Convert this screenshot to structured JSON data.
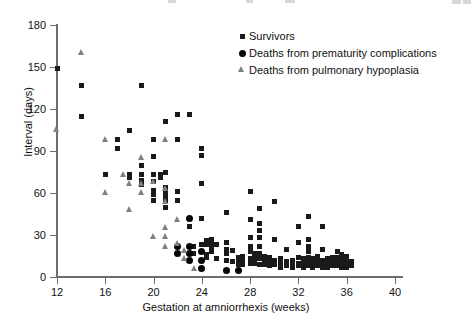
{
  "chart_data": {
    "type": "scatter",
    "title": "",
    "xlabel": "Gestation at amniorrhexis (weeks)",
    "ylabel": "Interval (days)",
    "xlim": [
      12,
      40
    ],
    "ylim": [
      0,
      180
    ],
    "xticks": [
      12,
      16,
      20,
      24,
      28,
      32,
      36,
      40
    ],
    "yticks": [
      0,
      30,
      60,
      90,
      120,
      150,
      180
    ],
    "grid": false,
    "legend_position": "top-right",
    "colors": {
      "survivors": "#1a1a1a",
      "deaths_prematurity": "#050505",
      "deaths_pulmonary": "#808080",
      "axis": "#6e6e6e",
      "background": "#ffffff"
    },
    "series": [
      {
        "name": "Survivors",
        "marker": "square",
        "color": "#1a1a1a",
        "points": [
          [
            12.0,
            149
          ],
          [
            14.0,
            137
          ],
          [
            14.0,
            115
          ],
          [
            16.0,
            73
          ],
          [
            17.0,
            98
          ],
          [
            17.0,
            92
          ],
          [
            18.0,
            105
          ],
          [
            18.0,
            73
          ],
          [
            18.0,
            71
          ],
          [
            19.0,
            137
          ],
          [
            19.0,
            80
          ],
          [
            19.0,
            73
          ],
          [
            19.0,
            69
          ],
          [
            19.0,
            66
          ],
          [
            20.0,
            98
          ],
          [
            20.0,
            86
          ],
          [
            20.0,
            73
          ],
          [
            20.0,
            68
          ],
          [
            20.0,
            62
          ],
          [
            20.0,
            59
          ],
          [
            20.0,
            55
          ],
          [
            20.6,
            73
          ],
          [
            20.6,
            71
          ],
          [
            21.0,
            111
          ],
          [
            21.0,
            75
          ],
          [
            21.0,
            64
          ],
          [
            21.0,
            61
          ],
          [
            21.0,
            58
          ],
          [
            21.0,
            55
          ],
          [
            21.0,
            50
          ],
          [
            22.0,
            116
          ],
          [
            22.0,
            98
          ],
          [
            22.0,
            61
          ],
          [
            22.0,
            55
          ],
          [
            23.0,
            116
          ],
          [
            23.0,
            36
          ],
          [
            23.3,
            22
          ],
          [
            23.3,
            17
          ],
          [
            24.0,
            92
          ],
          [
            24.0,
            87
          ],
          [
            24.0,
            67
          ],
          [
            24.0,
            42
          ],
          [
            24.0,
            23
          ],
          [
            24.0,
            18
          ],
          [
            24.0,
            12
          ],
          [
            24.4,
            26
          ],
          [
            24.4,
            23
          ],
          [
            24.4,
            16
          ],
          [
            24.4,
            14
          ],
          [
            24.8,
            27
          ],
          [
            24.8,
            24
          ],
          [
            24.8,
            22
          ],
          [
            24.8,
            18
          ],
          [
            25.2,
            23
          ],
          [
            25.2,
            13
          ],
          [
            26.0,
            46
          ],
          [
            26.0,
            25
          ],
          [
            26.0,
            20
          ],
          [
            26.0,
            17
          ],
          [
            26.0,
            12
          ],
          [
            26.5,
            19
          ],
          [
            26.5,
            11
          ],
          [
            27.0,
            14
          ],
          [
            27.0,
            11
          ],
          [
            27.0,
            9
          ],
          [
            27.4,
            15
          ],
          [
            27.4,
            12
          ],
          [
            27.4,
            9
          ],
          [
            28.0,
            61
          ],
          [
            28.0,
            41
          ],
          [
            28.0,
            28
          ],
          [
            28.0,
            22
          ],
          [
            28.0,
            18
          ],
          [
            28.0,
            13
          ],
          [
            28.0,
            10
          ],
          [
            28.4,
            17
          ],
          [
            28.4,
            13
          ],
          [
            28.4,
            10
          ],
          [
            28.8,
            49
          ],
          [
            28.8,
            38
          ],
          [
            28.8,
            33
          ],
          [
            28.8,
            28
          ],
          [
            28.8,
            22
          ],
          [
            28.8,
            17
          ],
          [
            28.8,
            13
          ],
          [
            28.8,
            9
          ],
          [
            29.2,
            15
          ],
          [
            29.2,
            12
          ],
          [
            29.2,
            9
          ],
          [
            29.6,
            14
          ],
          [
            29.6,
            11
          ],
          [
            29.6,
            8
          ],
          [
            30.0,
            54
          ],
          [
            30.0,
            27
          ],
          [
            30.0,
            12
          ],
          [
            30.0,
            9
          ],
          [
            30.5,
            13
          ],
          [
            30.5,
            10
          ],
          [
            30.5,
            7
          ],
          [
            31.0,
            20
          ],
          [
            31.0,
            11
          ],
          [
            31.0,
            8
          ],
          [
            31.5,
            12
          ],
          [
            31.5,
            9
          ],
          [
            31.5,
            7
          ],
          [
            32.0,
            36
          ],
          [
            32.0,
            25
          ],
          [
            32.0,
            14
          ],
          [
            32.0,
            10
          ],
          [
            32.0,
            8
          ],
          [
            32.4,
            13
          ],
          [
            32.4,
            10
          ],
          [
            32.4,
            7
          ],
          [
            32.8,
            43
          ],
          [
            32.8,
            27
          ],
          [
            32.8,
            22
          ],
          [
            32.8,
            18
          ],
          [
            32.8,
            14
          ],
          [
            32.8,
            11
          ],
          [
            32.8,
            8
          ],
          [
            33.2,
            13
          ],
          [
            33.2,
            10
          ],
          [
            33.2,
            7
          ],
          [
            33.6,
            15
          ],
          [
            33.6,
            11
          ],
          [
            33.6,
            8
          ],
          [
            34.0,
            36
          ],
          [
            34.0,
            20
          ],
          [
            34.0,
            12
          ],
          [
            34.0,
            9
          ],
          [
            34.0,
            7
          ],
          [
            34.4,
            13
          ],
          [
            34.4,
            10
          ],
          [
            34.4,
            7
          ],
          [
            34.8,
            14
          ],
          [
            34.8,
            11
          ],
          [
            34.8,
            8
          ],
          [
            35.2,
            18
          ],
          [
            35.2,
            14
          ],
          [
            35.2,
            11
          ],
          [
            35.2,
            8
          ],
          [
            35.6,
            16
          ],
          [
            35.6,
            13
          ],
          [
            35.6,
            10
          ],
          [
            35.6,
            7
          ],
          [
            36.0,
            15
          ],
          [
            36.0,
            12
          ],
          [
            36.0,
            9
          ],
          [
            36.0,
            7
          ],
          [
            36.4,
            11
          ],
          [
            36.4,
            8
          ]
        ]
      },
      {
        "name": "Deaths from prematurity complications",
        "marker": "circle",
        "color": "#050505",
        "points": [
          [
            22.0,
            22
          ],
          [
            22.0,
            17
          ],
          [
            23.0,
            42
          ],
          [
            23.0,
            22
          ],
          [
            23.0,
            17
          ],
          [
            23.0,
            12
          ],
          [
            24.0,
            18
          ],
          [
            24.0,
            12
          ],
          [
            24.0,
            6
          ],
          [
            26.0,
            5
          ],
          [
            27.0,
            5
          ]
        ]
      },
      {
        "name": "Deaths from pulmonary hypoplasia",
        "marker": "triangle",
        "color": "#808080",
        "points": [
          [
            12.0,
            105
          ],
          [
            14.0,
            160
          ],
          [
            16.0,
            98
          ],
          [
            16.0,
            60
          ],
          [
            17.5,
            73
          ],
          [
            18.0,
            67
          ],
          [
            18.0,
            48
          ],
          [
            19.0,
            85
          ],
          [
            19.0,
            67
          ],
          [
            19.0,
            60
          ],
          [
            20.0,
            68
          ],
          [
            20.0,
            29
          ],
          [
            21.0,
            98
          ],
          [
            21.0,
            63
          ],
          [
            21.0,
            54
          ],
          [
            21.0,
            35
          ],
          [
            21.0,
            29
          ],
          [
            21.0,
            22
          ],
          [
            22.0,
            41
          ],
          [
            22.0,
            24
          ],
          [
            22.6,
            19
          ],
          [
            22.6,
            13
          ],
          [
            23.4,
            6
          ]
        ]
      }
    ]
  },
  "legend": {
    "items": [
      {
        "label": "Survivors",
        "marker": "square"
      },
      {
        "label": "Deaths from prematurity complications",
        "marker": "circle"
      },
      {
        "label": "Deaths from pulmonary hypoplasia",
        "marker": "triangle"
      }
    ]
  },
  "axes": {
    "y_label": "Interval (days)",
    "x_label": "Gestation at amniorrhexis (weeks)",
    "y_ticks": [
      "0",
      "30",
      "60",
      "90",
      "120",
      "150",
      "180"
    ],
    "x_ticks": [
      "12",
      "16",
      "20",
      "24",
      "28",
      "32",
      "36",
      "40"
    ]
  }
}
